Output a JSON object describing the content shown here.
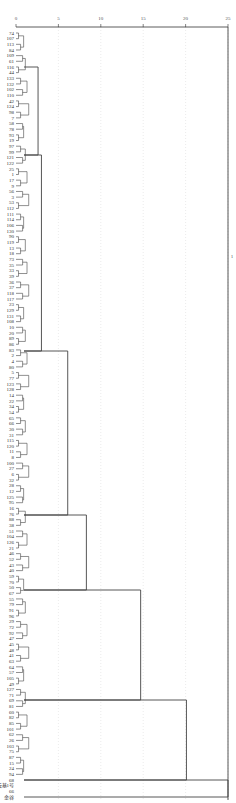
{
  "chart_data": {
    "type": "dendrogram",
    "title": "",
    "orientation": "horizontal",
    "xlabel": "Rescaled Distance Cluster Combine",
    "x_ticks": [
      0,
      5,
      10,
      15,
      20,
      25
    ],
    "xlim": [
      0,
      25
    ],
    "grid": true,
    "side_marker": "1",
    "leaf_labels": [
      "74",
      "107",
      "113",
      "84",
      "109",
      "61",
      "116",
      "44",
      "133",
      "132",
      "102",
      "110",
      "42",
      "124",
      "98",
      "7",
      "58",
      "78",
      "93",
      "19",
      "97",
      "99",
      "121",
      "122",
      "25",
      "1",
      "17",
      "9",
      "56",
      "3",
      "53",
      "112",
      "111",
      "114",
      "106",
      "130",
      "90",
      "119",
      "13",
      "18",
      "73",
      "35",
      "33",
      "39",
      "36",
      "37",
      "118",
      "117",
      "23",
      "129",
      "131",
      "108",
      "10",
      "20",
      "89",
      "86",
      "83",
      "2",
      "4",
      "80",
      "5",
      "77",
      "123",
      "128",
      "14",
      "22",
      "34",
      "54",
      "65",
      "66",
      "30",
      "31",
      "115",
      "120",
      "11",
      "8",
      "100",
      "27",
      "6",
      "32",
      "28",
      "12",
      "125",
      "95",
      "16",
      "76",
      "88",
      "38",
      "51",
      "104",
      "126",
      "21",
      "46",
      "52",
      "43",
      "40",
      "59",
      "70",
      "50",
      "67",
      "55",
      "79",
      "91",
      "96",
      "29",
      "72",
      "92",
      "47",
      "45",
      "48",
      "41",
      "63",
      "64",
      "57",
      "105",
      "49",
      "127",
      "71",
      "69",
      "81",
      "60",
      "82",
      "85",
      "101",
      "62",
      "26",
      "103",
      "75",
      "87",
      "15",
      "24",
      "94",
      "68",
      "云基1号",
      "66",
      "金谷"
    ],
    "major_merges": [
      {
        "from_y": 67,
        "to_y": 155,
        "distance": 2.6
      },
      {
        "from_y": 155,
        "to_y": 351,
        "distance": 3.0
      },
      {
        "from_y": 351,
        "to_y": 515,
        "distance": 6.1
      },
      {
        "from_y": 515,
        "to_y": 590,
        "distance": 8.3
      },
      {
        "from_y": 590,
        "to_y": 700,
        "distance": 14.7
      },
      {
        "from_y": 700,
        "to_y": 780,
        "distance": 20.1
      },
      {
        "from_y": 780,
        "to_y": 797,
        "distance": 25.0
      }
    ]
  }
}
